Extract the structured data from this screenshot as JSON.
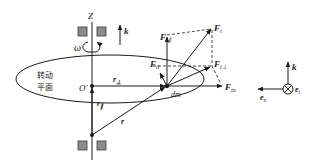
{
  "figure": {
    "axis_label": "Z",
    "omega_label": "ω",
    "k_label": "k",
    "plane_label_line1": "转动",
    "plane_label_line2": "平面",
    "origin_label": "O′",
    "r_perp_label": "r",
    "r_perp_sub": "⊥",
    "r_par_label": "r",
    "r_par_sub": "∥",
    "r_label": "r",
    "dm_label": "dm",
    "forces": {
      "Fi": {
        "main": "F",
        "sub": "i"
      },
      "Fi_par": {
        "main": "F",
        "sub": "i∥"
      },
      "Fi_perp": {
        "main": "F",
        "sub": "i⊥"
      },
      "Fin": {
        "main": "F",
        "sub": "in"
      },
      "Fit": {
        "main": "F",
        "sub": "it"
      }
    },
    "frame": {
      "k_label": "k",
      "en_label": "e",
      "en_sub": "n",
      "et_label": "e",
      "et_sub": "t"
    }
  },
  "colors": {
    "line": "#1a1a1a",
    "bearing_fill": "#8c8c8c",
    "bearing_stroke": "#3a3a3a",
    "background": "#ffffff"
  }
}
